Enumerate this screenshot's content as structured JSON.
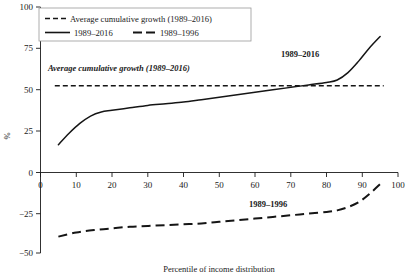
{
  "chart_data": {
    "type": "line",
    "title": "",
    "xlabel": "Percentile of income distribution",
    "ylabel": "%",
    "xlim": [
      0,
      100
    ],
    "ylim": [
      -50,
      100
    ],
    "xticks": [
      0,
      10,
      20,
      30,
      40,
      50,
      60,
      70,
      80,
      90,
      100
    ],
    "yticks": [
      -50,
      -25,
      0,
      25,
      50,
      75,
      100
    ],
    "grid": false,
    "legend_position": "top-left",
    "legend": [
      "Average cumulative growth (1989–2016)",
      "1989–2016",
      "1989–1996"
    ],
    "annotations": [
      {
        "text": "Average cumulative growth (1989–2016)",
        "x": 12,
        "y": 61,
        "style": "bold-italic"
      },
      {
        "text": "1989–2016",
        "x": 74,
        "y": 69,
        "style": "bold"
      },
      {
        "text": "1989–1996",
        "x": 58,
        "y": -21,
        "style": "bold"
      }
    ],
    "series": [
      {
        "name": "Average cumulative growth (1989–2016)",
        "style": "dashed",
        "x": [
          4,
          96
        ],
        "values": [
          52,
          52
        ]
      },
      {
        "name": "1989–2016",
        "style": "solid",
        "x": [
          5,
          8,
          11,
          14,
          17,
          20,
          25,
          30,
          35,
          40,
          45,
          50,
          55,
          60,
          65,
          70,
          75,
          80,
          83,
          86,
          89,
          92,
          95
        ],
        "values": [
          16,
          23,
          29,
          33.5,
          36,
          37,
          38.5,
          40,
          41,
          42,
          43.5,
          45,
          46.5,
          48,
          49.5,
          51,
          52.5,
          54,
          55.5,
          60,
          67,
          75,
          82
        ]
      },
      {
        "name": "1989–1996",
        "style": "long-dashed",
        "x": [
          5,
          10,
          15,
          20,
          25,
          30,
          35,
          40,
          45,
          50,
          55,
          60,
          65,
          70,
          75,
          80,
          83,
          86,
          89,
          92,
          95
        ],
        "values": [
          -40,
          -37.5,
          -36,
          -35,
          -34,
          -33.5,
          -33,
          -32.5,
          -32,
          -31,
          -30,
          -29,
          -28,
          -27,
          -26,
          -25,
          -24,
          -22,
          -19,
          -14,
          -8
        ]
      }
    ]
  },
  "legend": {
    "row1_label": "Average cumulative growth (1989–2016)",
    "row2_label_a": "1989–2016",
    "row2_label_b": "1989–1996"
  },
  "axes": {
    "y_title": "%",
    "x_title": "Percentile of income distribution",
    "y_tick_labels": [
      "100",
      "75",
      "50",
      "25",
      "0",
      "−25",
      "−50"
    ],
    "x_tick_labels": [
      "0",
      "10",
      "20",
      "30",
      "40",
      "50",
      "60",
      "70",
      "80",
      "90",
      "100"
    ]
  },
  "annotations": {
    "avg_growth": "Average cumulative growth (1989–2016)",
    "upper_curve": "1989–2016",
    "lower_curve": "1989–1996"
  }
}
